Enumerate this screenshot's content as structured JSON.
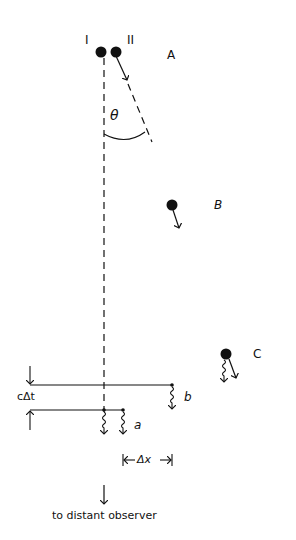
{
  "labels": {
    "ball_I": "I",
    "ball_II": "II",
    "position_A": "A",
    "position_B": "B",
    "position_C": "C",
    "angle": "θ",
    "time_gap": "cΔt",
    "pulse_a": "a",
    "pulse_b": "b",
    "separation": "Δx",
    "observer": "to distant observer"
  },
  "colors": {
    "ink": "#111111",
    "background": "#ffffff"
  }
}
